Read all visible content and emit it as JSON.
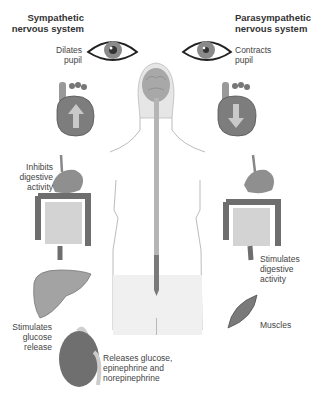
{
  "diagram": {
    "left_column": {
      "title_line1": "Sympathetic",
      "title_line2": "nervous system",
      "labels": {
        "pupil": [
          "Dilates",
          "pupil"
        ],
        "digestive": [
          "Inhibits",
          "digestive",
          "activity"
        ],
        "glucose": [
          "Stimulates",
          "glucose",
          "release"
        ],
        "adrenal": [
          "Releases glucose,",
          "epinephrine and",
          "norepinephrine"
        ]
      },
      "heart_arrow": "up"
    },
    "right_column": {
      "title_line1": "Parasympathetic",
      "title_line2": "nervous system",
      "labels": {
        "pupil": [
          "Contracts",
          "pupil"
        ],
        "digestive": [
          "Stimulates",
          "digestive",
          "activity"
        ],
        "muscles": [
          "Muscles"
        ]
      },
      "heart_arrow": "down"
    },
    "colors": {
      "organ_fill": "#8a8a8a",
      "organ_dark": "#5a5a5a",
      "organ_light": "#c8c8c8",
      "body_outline": "#9a9a9a",
      "text": "#333333"
    }
  }
}
